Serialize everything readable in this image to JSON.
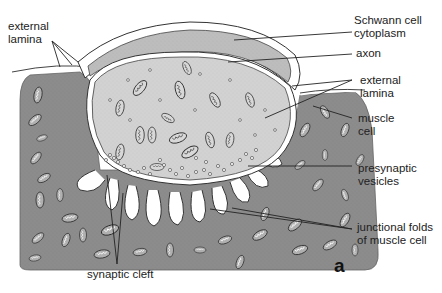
{
  "figure": {
    "panel_letter": "a",
    "colors": {
      "muscle": "#8c8c8c",
      "axon": "#d2d2d2",
      "schwann": "#bdbdbd",
      "membrane": "#ffffff",
      "outline": "#3a3a3a",
      "text": "#222222",
      "background": "#ffffff"
    }
  },
  "labels": {
    "external_lamina_left": {
      "line1": "external",
      "line2": "lamina"
    },
    "schwann_cell": {
      "line1": "Schwann cell",
      "line2": "cytoplasm"
    },
    "axon": {
      "line1": "axon"
    },
    "external_lamina_right": {
      "line1": "external",
      "line2": "lamina"
    },
    "muscle_cell": {
      "line1": "muscle",
      "line2": "cell"
    },
    "presynaptic_vesicles": {
      "line1": "presynaptic",
      "line2": "vesicles"
    },
    "junctional_folds": {
      "line1": "junctional folds",
      "line2": "of muscle cell"
    },
    "synaptic_cleft": {
      "line1": "synaptic cleft"
    }
  }
}
